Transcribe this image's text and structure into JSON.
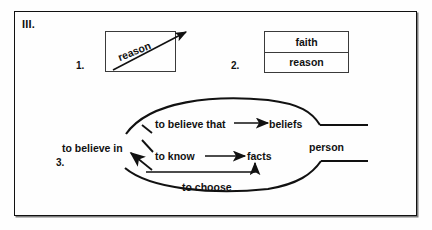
{
  "figure": {
    "roman_label": "III.",
    "background_color": "#fefefe",
    "line_color": "#111111",
    "frame_color": "#111111"
  },
  "items": [
    {
      "number": "1.",
      "type": "box-with-diagonal-arrow",
      "label": "reason",
      "description": "rectangle containing an upward diagonal arrow labelled reason that extends past the box"
    },
    {
      "number": "2.",
      "type": "two-row-box",
      "rows": [
        "faith",
        "reason"
      ]
    },
    {
      "number": "3.",
      "type": "ellipse-flow",
      "left_node": "to believe in",
      "right_node": "person",
      "branches": [
        {
          "from": "to believe in",
          "via": "to believe that",
          "to": "beliefs"
        },
        {
          "from": "to believe in",
          "via": "to know",
          "to": "facts"
        }
      ],
      "return_path": {
        "label": "to choose",
        "to": "to believe in"
      }
    }
  ],
  "labels": {
    "believe_in": "to believe in",
    "believe_that": "to believe that",
    "beliefs": "beliefs",
    "know": "to know",
    "facts": "facts",
    "choose": "to choose",
    "person": "person",
    "reason": "reason",
    "faith": "faith"
  },
  "numbers": {
    "one": "1.",
    "two": "2.",
    "three": "3."
  }
}
